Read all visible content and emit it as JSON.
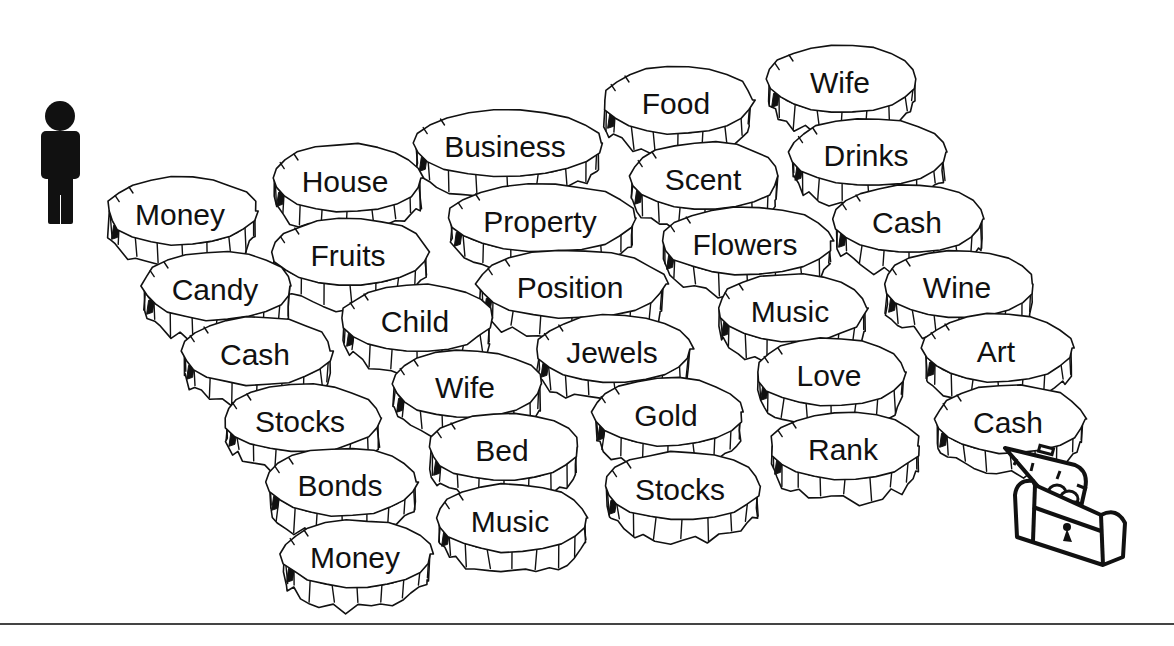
{
  "figure": {
    "start_icon": "person-icon",
    "end_icon": "treasure-chest-icon",
    "stones": [
      {
        "col": 5,
        "label": "Wife",
        "x": 840,
        "y": 85
      },
      {
        "col": 4,
        "label": "Food",
        "x": 676,
        "y": 106
      },
      {
        "col": 3,
        "label": "Business",
        "x": 505,
        "y": 149
      },
      {
        "col": 5,
        "label": "Drinks",
        "x": 866,
        "y": 158
      },
      {
        "col": 2,
        "label": "House",
        "x": 345,
        "y": 184
      },
      {
        "col": 4,
        "label": "Scent",
        "x": 703,
        "y": 182
      },
      {
        "col": 1,
        "label": "Money",
        "x": 180,
        "y": 217
      },
      {
        "col": 3,
        "label": "Property",
        "x": 540,
        "y": 224
      },
      {
        "col": 5,
        "label": "Cash",
        "x": 907,
        "y": 225
      },
      {
        "col": 4,
        "label": "Flowers",
        "x": 745,
        "y": 247
      },
      {
        "col": 2,
        "label": "Fruits",
        "x": 348,
        "y": 258
      },
      {
        "col": 3,
        "label": "Position",
        "x": 570,
        "y": 290
      },
      {
        "col": 5,
        "label": "Wine",
        "x": 957,
        "y": 290
      },
      {
        "col": 1,
        "label": "Candy",
        "x": 215,
        "y": 292
      },
      {
        "col": 4,
        "label": "Music",
        "x": 790,
        "y": 314
      },
      {
        "col": 2,
        "label": "Child",
        "x": 415,
        "y": 324
      },
      {
        "col": 5,
        "label": "Art",
        "x": 996,
        "y": 354
      },
      {
        "col": 3,
        "label": "Jewels",
        "x": 612,
        "y": 355
      },
      {
        "col": 1,
        "label": "Cash",
        "x": 255,
        "y": 357
      },
      {
        "col": 4,
        "label": "Love",
        "x": 829,
        "y": 378
      },
      {
        "col": 2,
        "label": "Wife",
        "x": 465,
        "y": 390
      },
      {
        "col": 3,
        "label": "Gold",
        "x": 666,
        "y": 418
      },
      {
        "col": 1,
        "label": "Stocks",
        "x": 300,
        "y": 424
      },
      {
        "col": 5,
        "label": "Cash",
        "x": 1008,
        "y": 425
      },
      {
        "col": 4,
        "label": "Rank",
        "x": 843,
        "y": 452
      },
      {
        "col": 2,
        "label": "Bed",
        "x": 502,
        "y": 453
      },
      {
        "col": 1,
        "label": "Bonds",
        "x": 340,
        "y": 488
      },
      {
        "col": 3,
        "label": "Stocks",
        "x": 680,
        "y": 492
      },
      {
        "col": 2,
        "label": "Music",
        "x": 510,
        "y": 524
      },
      {
        "col": 1,
        "label": "Money",
        "x": 355,
        "y": 560
      }
    ]
  },
  "colors": {
    "ink": "#111111",
    "background": "#ffffff",
    "rule": "#444444"
  }
}
